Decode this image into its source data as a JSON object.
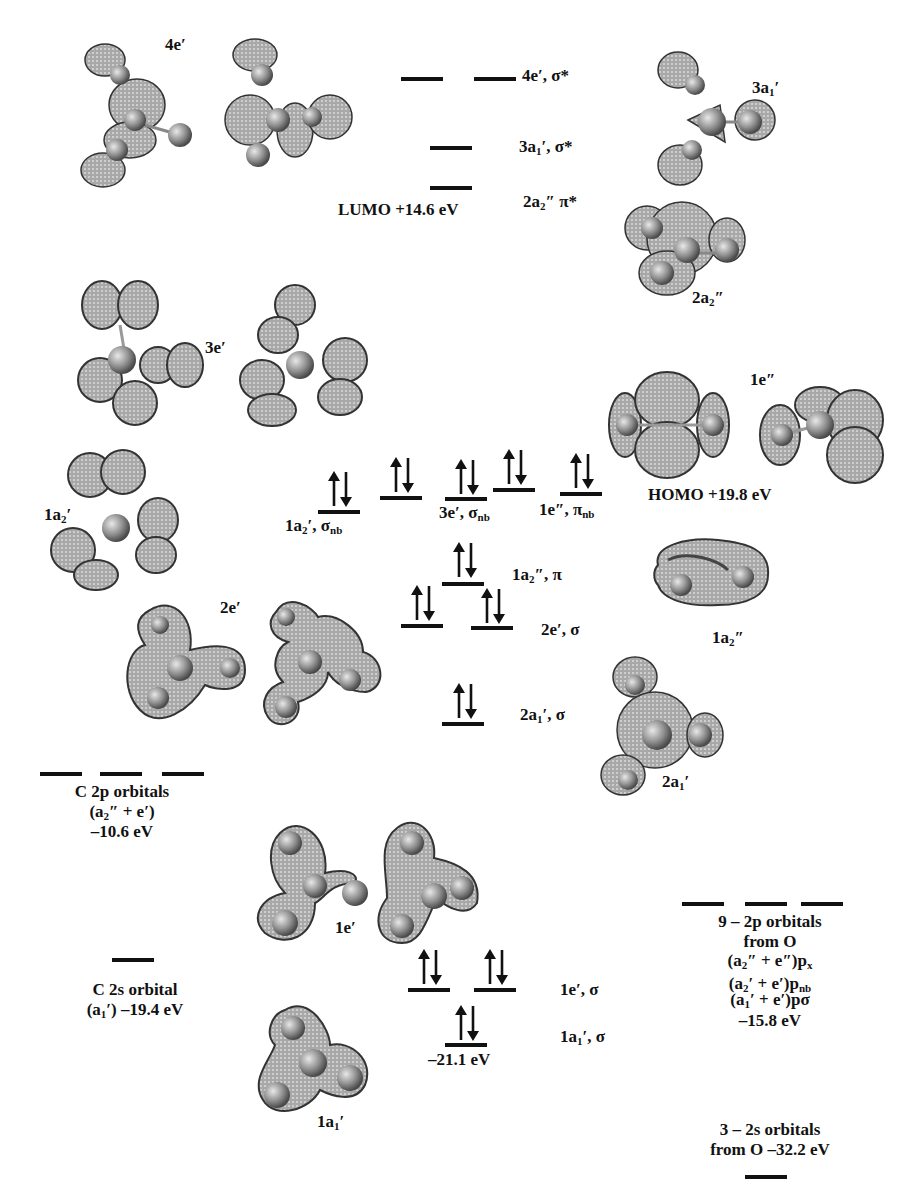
{
  "diagram": {
    "type": "molecular_orbital_energy_diagram",
    "symmetry": "D3h",
    "colors": {
      "line": "#111111",
      "lobe_fill": "#9a9a9a",
      "lobe_edge": "#333333",
      "atom": "#8a8a8a"
    }
  },
  "mo_levels": {
    "4e_sigma_star": {
      "label": "4e′, σ*"
    },
    "3a1_sigma_star": {
      "label_main": "3a",
      "label_sub": "1",
      "label_rest": "′, σ*"
    },
    "2a2_pi_star": {
      "label_main": "2a",
      "label_sub": "2",
      "label_rest": "″ π*"
    },
    "lumo": {
      "label": "LUMO +14.6 eV"
    },
    "1a2_sigma_nb": {
      "label_main": "1a",
      "label_sub": "2",
      "label_rest": "′, σ",
      "label_sub2": "nb"
    },
    "3e_sigma_nb": {
      "label_main": "3e′, σ",
      "label_sub2": "nb"
    },
    "1e2_pi_nb": {
      "label_main": "1e″, π",
      "label_sub2": "nb"
    },
    "homo": {
      "label": "HOMO +19.8 eV"
    },
    "1a2pp_pi": {
      "label_main": "1a",
      "label_sub": "2",
      "label_rest": "″, π"
    },
    "2e_sigma": {
      "label": "2e′, σ"
    },
    "2a1_sigma": {
      "label_main": "2a",
      "label_sub": "1",
      "label_rest": "′, σ"
    },
    "1e_sigma": {
      "label": "1e′, σ"
    },
    "1a1_sigma": {
      "label_main": "1a",
      "label_sub": "1",
      "label_rest": "′, σ"
    },
    "lowest_energy": {
      "label": "–21.1 eV"
    }
  },
  "carbon_ao": {
    "c2p": {
      "line1": "C 2p orbitals",
      "line2_main": "(a",
      "line2_sub": "2",
      "line2_rest": "″ + e′)",
      "line3": "–10.6 eV"
    },
    "c2s": {
      "line1": "C 2s orbital",
      "line2_main": "(a",
      "line2_sub": "1",
      "line2_rest": "′) –19.4 eV"
    }
  },
  "oxygen_ao": {
    "o2p": {
      "line1": "9 – 2p orbitals",
      "line2": "from O",
      "line3_main": "(a",
      "line3_sub": "2",
      "line3_rest": "″ + e″)p",
      "line3_sub2": "x",
      "line4_main": "(a",
      "line4_sub": "2",
      "line4_rest": "′ + e′)p",
      "line4_sub2": "nb",
      "line5_main": "(a",
      "line5_sub": "1",
      "line5_rest": "′ + e′)pσ",
      "line6": "–15.8 eV"
    },
    "o2s": {
      "line1": "3 – 2s orbitals",
      "line2": "from O –32.2 eV"
    }
  },
  "orbital_images": {
    "4e": {
      "label": "4e′"
    },
    "3a1": {
      "label_main": "3a",
      "label_sub": "1",
      "label_rest": "′"
    },
    "2a2": {
      "label_main": "2a",
      "label_sub": "2",
      "label_rest": "″"
    },
    "3e": {
      "label": "3e′"
    },
    "1e2": {
      "label": "1e″"
    },
    "1a2": {
      "label_main": "1a",
      "label_sub": "2",
      "label_rest": "′"
    },
    "2e": {
      "label": "2e′"
    },
    "1a2pp": {
      "label_main": "1a",
      "label_sub": "2",
      "label_rest": "″"
    },
    "2a1": {
      "label_main": "2a",
      "label_sub": "1",
      "label_rest": "′"
    },
    "1e": {
      "label": "1e′"
    },
    "1a1": {
      "label_main": "1a",
      "label_sub": "1",
      "label_rest": "′"
    }
  }
}
